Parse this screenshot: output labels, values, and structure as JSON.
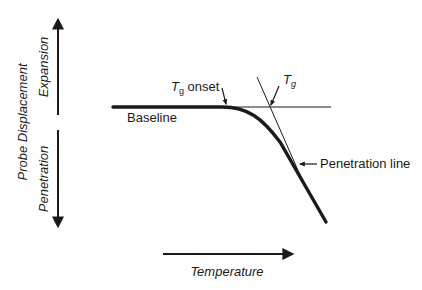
{
  "diagram": {
    "y_axis": {
      "title": "Probe Displacement",
      "upper_label": "Expansion",
      "lower_label": "Penetration"
    },
    "x_axis": {
      "title": "Temperature"
    },
    "annotations": {
      "baseline": "Baseline",
      "tg_onset_symbol": "T",
      "tg_onset_subscript": "g",
      "tg_onset_text": " onset",
      "tg_symbol": "T",
      "tg_subscript": "g",
      "penetration_line": "Penetration line"
    },
    "colors": {
      "ink": "#1a1a1a",
      "background": "#ffffff"
    }
  }
}
